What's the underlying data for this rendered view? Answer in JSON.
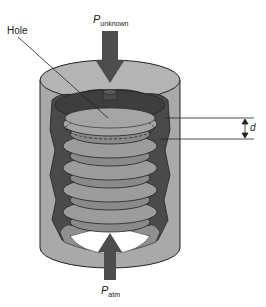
{
  "diagram": {
    "labels": {
      "hole": "Hole",
      "p_unknown_main": "P",
      "p_unknown_sub": "unknown",
      "p_atm_main": "P",
      "p_atm_sub": "atm",
      "displacement": "d"
    },
    "arrows": [
      {
        "name": "p-unknown-arrow",
        "direction": "down",
        "meaning": "unknown pressure applied to top"
      },
      {
        "name": "p-atm-arrow",
        "direction": "up",
        "meaning": "atmospheric pressure applied from bottom"
      }
    ],
    "bellows_convolutions": 6,
    "colors": {
      "housing": "#a9a9a9",
      "housing_dark": "#4a4a4a",
      "bellows": "#9c9c9c",
      "arrow": "#4d4d4d",
      "outline": "#222222",
      "background": "#ffffff"
    }
  }
}
